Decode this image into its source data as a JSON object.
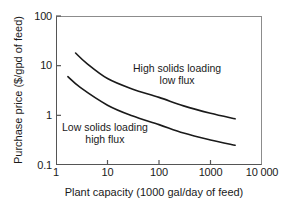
{
  "chart_data": {
    "type": "line",
    "title": "",
    "xlabel": "Plant capacity (1000 gal/day of feed)",
    "ylabel": "Purchase price ($/gpd of feed)",
    "xscale": "log",
    "yscale": "log",
    "xlim": [
      1,
      10000
    ],
    "ylim": [
      0.1,
      100
    ],
    "grid": false,
    "legend": "none",
    "xticklabels": [
      "1",
      "10",
      "100",
      "1000",
      "10 000"
    ],
    "xtickvalues": [
      1,
      10,
      100,
      1000,
      10000
    ],
    "yticklabels": [
      "0.1",
      "1",
      "10",
      "100"
    ],
    "ytickvalues": [
      0.1,
      1,
      10,
      100
    ],
    "series": [
      {
        "name": "High solids loading low flux",
        "x": [
          2.4,
          4,
          10,
          30,
          100,
          300,
          1000,
          3000
        ],
        "y": [
          18.0,
          11.0,
          5.5,
          3.4,
          2.3,
          1.55,
          1.1,
          0.85
        ]
      },
      {
        "name": "Low solids loading high flux",
        "x": [
          1.7,
          3,
          10,
          30,
          100,
          300,
          1000,
          3000
        ],
        "y": [
          6.0,
          3.6,
          1.6,
          0.98,
          0.65,
          0.44,
          0.32,
          0.25
        ]
      }
    ],
    "annotations": [
      {
        "id": "high",
        "line1": "High solids loading",
        "line2": "low flux"
      },
      {
        "id": "low",
        "line1": "Low solids loading",
        "line2": "high flux"
      }
    ],
    "colors": {
      "curve": "#1a1a1a",
      "axis": "#555555",
      "frame_light": "#8c8c8c",
      "background": "#ffffff",
      "text": "#1a1a1a"
    }
  }
}
